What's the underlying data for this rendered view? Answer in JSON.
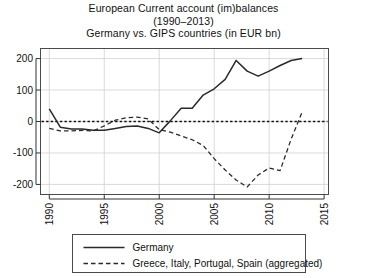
{
  "chart_data": {
    "type": "line",
    "title": "European Current account (im)balances",
    "title_line2": "(1990–2013)",
    "title_line3": "Germany vs. GIPS countries (in EUR bn)",
    "xlabel": "",
    "ylabel": "",
    "xlim": [
      1989.2,
      2015.4
    ],
    "ylim": [
      -232,
      232
    ],
    "xticks": [
      1990,
      1995,
      2000,
      2005,
      2010,
      2015
    ],
    "xticklabels": [
      "1990",
      "1995",
      "2000",
      "2005",
      "2010",
      "2015"
    ],
    "yticks": [
      -200,
      -100,
      0,
      100,
      200
    ],
    "yticklabels": [
      "-200",
      "-100",
      "0",
      "100",
      "200"
    ],
    "grid": true,
    "zero_reference_line": 0,
    "legend_position": "below-plot",
    "x": [
      1990,
      1991,
      1992,
      1993,
      1994,
      1995,
      1996,
      1997,
      1998,
      1999,
      2000,
      2001,
      2002,
      2003,
      2004,
      2005,
      2006,
      2007,
      2008,
      2009,
      2010,
      2011,
      2012,
      2013
    ],
    "series": [
      {
        "name": "Germany",
        "style": "solid",
        "color": "#2a2a2a",
        "values": [
          40,
          -18,
          -24,
          -24,
          -28,
          -28,
          -22,
          -16,
          -14,
          -22,
          -36,
          2,
          42,
          42,
          84,
          104,
          134,
          194,
          160,
          144,
          160,
          178,
          194,
          200
        ]
      },
      {
        "name": "Greece, Italy, Portugal, Spain (aggregated)",
        "style": "dashed",
        "color": "#2a2a2a",
        "values": [
          -22,
          -30,
          -30,
          -28,
          -30,
          -14,
          4,
          12,
          14,
          8,
          -26,
          -34,
          -46,
          -58,
          -76,
          -118,
          -154,
          -186,
          -208,
          -170,
          -148,
          -156,
          -56,
          30
        ]
      }
    ]
  },
  "legend": {
    "entries": [
      {
        "label": "Germany",
        "style": "solid"
      },
      {
        "label": "Greece, Italy, Portugal, Spain (aggregated)",
        "style": "dashed"
      }
    ]
  }
}
